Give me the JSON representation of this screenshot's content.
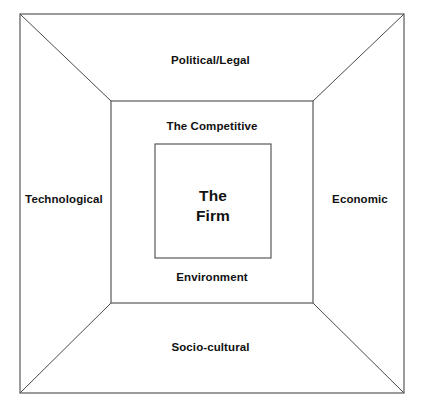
{
  "diagram": {
    "type": "concentric-nested-frames",
    "colors": {
      "background": "#ffffff",
      "line": "#4a4a4a",
      "text": "#111111"
    },
    "layers": [
      {
        "id": "macro-environment",
        "name": "Macro Environment",
        "labels": [
          "Political/Legal",
          "Economic",
          "Socio-cultural",
          "Technological"
        ]
      },
      {
        "id": "competitive-environment",
        "name": "The Competitive Environment",
        "labels": [
          "The Competitive",
          "Environment"
        ]
      },
      {
        "id": "core",
        "name": "The Firm",
        "labels": [
          "The",
          "Firm"
        ]
      }
    ]
  },
  "labels": {
    "political_legal": "Political/Legal",
    "socio_cultural": "Socio-cultural",
    "technological": "Technological",
    "economic": "Economic",
    "competitive": "The Competitive",
    "environment": "Environment",
    "firm_line1": "The",
    "firm_line2": "Firm"
  },
  "geometry": {
    "outer_rect": {
      "x": 20,
      "y": 14,
      "width": 384,
      "height": 379
    },
    "middle_rect": {
      "x": 111,
      "y": 101,
      "width": 202,
      "height": 202
    },
    "inner_rect": {
      "x": 155,
      "y": 144,
      "width": 116,
      "height": 114
    },
    "diagonals": [
      {
        "from": "outer-top-left",
        "to": "middle-top-left"
      },
      {
        "from": "outer-top-right",
        "to": "middle-top-right"
      },
      {
        "from": "outer-bottom-right",
        "to": "middle-bottom-right"
      },
      {
        "from": "outer-bottom-left",
        "to": "middle-bottom-left"
      }
    ]
  }
}
